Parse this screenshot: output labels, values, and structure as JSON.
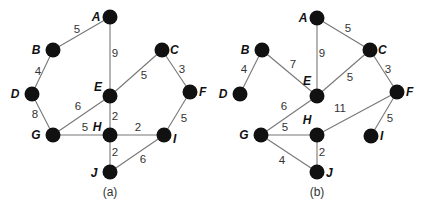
{
  "graphs": [
    {
      "id": "a",
      "caption": "(a)",
      "caption_pos": [
        110,
        196
      ],
      "nodes": [
        {
          "id": "A",
          "x": 110,
          "y": 17,
          "lx": -14,
          "ly": 4
        },
        {
          "id": "B",
          "x": 53,
          "y": 50,
          "lx": -17,
          "ly": 4
        },
        {
          "id": "C",
          "x": 162,
          "y": 50,
          "lx": 8,
          "ly": 4
        },
        {
          "id": "D",
          "x": 32,
          "y": 94,
          "lx": -17,
          "ly": 4
        },
        {
          "id": "E",
          "x": 110,
          "y": 96,
          "lx": -12,
          "ly": -5
        },
        {
          "id": "F",
          "x": 190,
          "y": 92,
          "lx": 9,
          "ly": 4
        },
        {
          "id": "G",
          "x": 53,
          "y": 135,
          "lx": -17,
          "ly": 4
        },
        {
          "id": "H",
          "x": 110,
          "y": 135,
          "lx": -13,
          "ly": -4
        },
        {
          "id": "I",
          "x": 164,
          "y": 135,
          "lx": 9,
          "ly": 8
        },
        {
          "id": "J",
          "x": 110,
          "y": 172,
          "lx": -16,
          "ly": 5
        }
      ],
      "edges": [
        {
          "from": "A",
          "to": "B",
          "w": "5",
          "wx": 77,
          "wy": 33
        },
        {
          "from": "A",
          "to": "E",
          "w": "9",
          "wx": 115,
          "wy": 57
        },
        {
          "from": "B",
          "to": "D",
          "w": "4",
          "wx": 38,
          "wy": 75
        },
        {
          "from": "C",
          "to": "E",
          "w": "5",
          "wx": 144,
          "wy": 79
        },
        {
          "from": "C",
          "to": "F",
          "w": "3",
          "wx": 182,
          "wy": 73
        },
        {
          "from": "D",
          "to": "G",
          "w": "8",
          "wx": 35,
          "wy": 118
        },
        {
          "from": "E",
          "to": "G",
          "w": "6",
          "wx": 78,
          "wy": 110
        },
        {
          "from": "E",
          "to": "H",
          "w": "2",
          "wx": 115,
          "wy": 120
        },
        {
          "from": "F",
          "to": "I",
          "w": "5",
          "wx": 184,
          "wy": 122
        },
        {
          "from": "G",
          "to": "H",
          "w": "5",
          "wx": 85,
          "wy": 131
        },
        {
          "from": "H",
          "to": "I",
          "w": "2",
          "wx": 138,
          "wy": 131
        },
        {
          "from": "H",
          "to": "J",
          "w": "2",
          "wx": 115,
          "wy": 156
        },
        {
          "from": "I",
          "to": "J",
          "w": "6",
          "wx": 143,
          "wy": 163
        }
      ]
    },
    {
      "id": "b",
      "caption": "(b)",
      "caption_pos": [
        317,
        196
      ],
      "nodes": [
        {
          "id": "A",
          "x": 317,
          "y": 18,
          "lx": -14,
          "ly": 4
        },
        {
          "id": "B",
          "x": 262,
          "y": 50,
          "lx": -17,
          "ly": 4
        },
        {
          "id": "C",
          "x": 370,
          "y": 50,
          "lx": 8,
          "ly": 4
        },
        {
          "id": "D",
          "x": 240,
          "y": 94,
          "lx": -17,
          "ly": 4
        },
        {
          "id": "E",
          "x": 317,
          "y": 96,
          "lx": -10,
          "ly": -11
        },
        {
          "id": "F",
          "x": 397,
          "y": 92,
          "lx": 9,
          "ly": 4
        },
        {
          "id": "G",
          "x": 261,
          "y": 135,
          "lx": -17,
          "ly": 4
        },
        {
          "id": "H",
          "x": 317,
          "y": 135,
          "lx": -10,
          "ly": -11
        },
        {
          "id": "I",
          "x": 371,
          "y": 136,
          "lx": 9,
          "ly": 4
        },
        {
          "id": "J",
          "x": 317,
          "y": 172,
          "lx": 9,
          "ly": 5
        }
      ],
      "edges": [
        {
          "from": "A",
          "to": "C",
          "w": "5",
          "wx": 348,
          "wy": 32
        },
        {
          "from": "A",
          "to": "E",
          "w": "9",
          "wx": 322,
          "wy": 57
        },
        {
          "from": "B",
          "to": "D",
          "w": "4",
          "wx": 244,
          "wy": 73
        },
        {
          "from": "B",
          "to": "E",
          "w": "7",
          "wx": 293,
          "wy": 68
        },
        {
          "from": "C",
          "to": "E",
          "w": "5",
          "wx": 350,
          "wy": 81
        },
        {
          "from": "C",
          "to": "F",
          "w": "3",
          "wx": 388,
          "wy": 73
        },
        {
          "from": "E",
          "to": "G",
          "w": "6",
          "wx": 284,
          "wy": 110
        },
        {
          "from": "F",
          "to": "H",
          "w": "11",
          "wx": 340,
          "wy": 112
        },
        {
          "from": "F",
          "to": "I",
          "w": "5",
          "wx": 390,
          "wy": 122
        },
        {
          "from": "G",
          "to": "H",
          "w": "5",
          "wx": 285,
          "wy": 131
        },
        {
          "from": "G",
          "to": "J",
          "w": "4",
          "wx": 282,
          "wy": 164
        },
        {
          "from": "H",
          "to": "J",
          "w": "2",
          "wx": 322,
          "wy": 156
        }
      ]
    }
  ]
}
